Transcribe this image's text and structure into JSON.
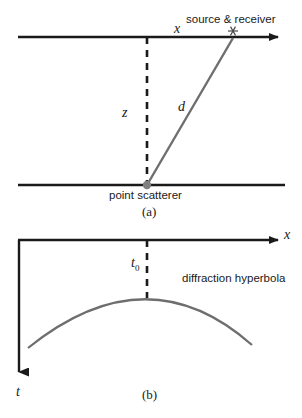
{
  "figure": {
    "top_cropped_text": "",
    "panel_a": {
      "caption": "(a)",
      "labels": {
        "source_receiver": "source & receiver",
        "offset_x": "x",
        "depth_z": "z",
        "distance_d": "d",
        "scatterer": "point scatterer"
      },
      "markers": {
        "source_symbol": "asterisk-marker",
        "scatterer_symbol": "filled-dot-marker"
      }
    },
    "panel_b": {
      "caption": "(b)",
      "labels": {
        "axis_x": "x",
        "axis_t": "t",
        "t_zero": "t",
        "t_zero_subscript": "0",
        "hyperbola": "diffraction hyperbola"
      }
    },
    "colors": {
      "line": "#1a1a1a",
      "ray": "#6e6e6e",
      "curve": "#6e6e6e",
      "marker": "#808080",
      "background": "#ffffff"
    }
  }
}
